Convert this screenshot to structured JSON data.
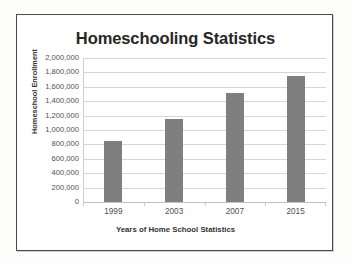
{
  "chart_data": {
    "type": "bar",
    "title": "Homeschooling Statistics",
    "xlabel": "Years of Home School Statistics",
    "ylabel": "Homeschool Enrollment",
    "categories": [
      "1999",
      "2003",
      "2007",
      "2015"
    ],
    "values": [
      850000,
      1150000,
      1520000,
      1750000
    ],
    "ylim": [
      0,
      2000000
    ],
    "ytick_step": 200000,
    "ytick_labels": [
      "2,000,000",
      "1,800,000",
      "1,600,000",
      "1,400,000",
      "1,200,000",
      "1,000,000",
      "800,000",
      "600,000",
      "400,000",
      "200,000",
      "0"
    ],
    "ytick_values": [
      2000000,
      1800000,
      1600000,
      1400000,
      1200000,
      1000000,
      800000,
      600000,
      400000,
      200000,
      0
    ],
    "grid": true,
    "legend": false,
    "legend_position": "none",
    "series": [
      {
        "name": "Homeschool Enrollment",
        "values": [
          850000,
          1150000,
          1520000,
          1750000
        ]
      }
    ],
    "colors": {
      "bar": "#7f7f7f",
      "gridline": "#d6d6d6",
      "axis": "#cfcfcf",
      "title_text": "#262626",
      "label_text": "#4f4f4f",
      "frame_border": "#4a4a4a",
      "background": "#ffffff"
    }
  }
}
